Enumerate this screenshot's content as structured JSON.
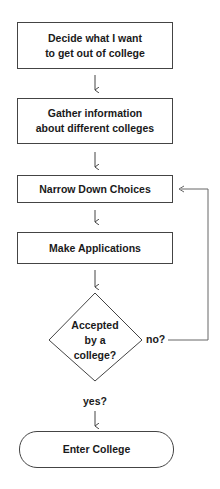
{
  "flowchart": {
    "steps": [
      {
        "id": "step1",
        "label_line1": "Decide what I want",
        "label_line2": "to get out of college"
      },
      {
        "id": "step2",
        "label_line1": "Gather information",
        "label_line2": "about different colleges"
      },
      {
        "id": "step3",
        "label": "Narrow Down Choices"
      },
      {
        "id": "step4",
        "label": "Make Applications"
      }
    ],
    "decision": {
      "line1": "Accepted",
      "line2": "by a",
      "line3": "college?"
    },
    "branches": {
      "no_label": "no?",
      "yes_label": "yes?"
    },
    "terminal": {
      "label": "Enter College"
    }
  }
}
